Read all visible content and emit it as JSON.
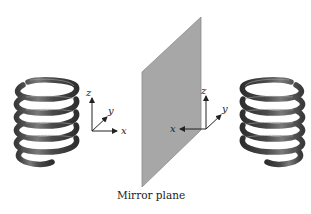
{
  "figure": {
    "caption": "Mirror plane",
    "left_object": {
      "type": "helix-spring",
      "axes": {
        "x": "x",
        "y": "y",
        "z": "z"
      }
    },
    "right_object": {
      "type": "helix-spring-mirrored",
      "axes": {
        "x": "x",
        "y": "y",
        "z": "z"
      }
    },
    "colors": {
      "plane": "#a7a7a7",
      "plane_edge": "#8a8a8a",
      "spring": "#4a4a4a",
      "spring_highlight": "#8c8c8c",
      "axis": "#222222"
    }
  }
}
